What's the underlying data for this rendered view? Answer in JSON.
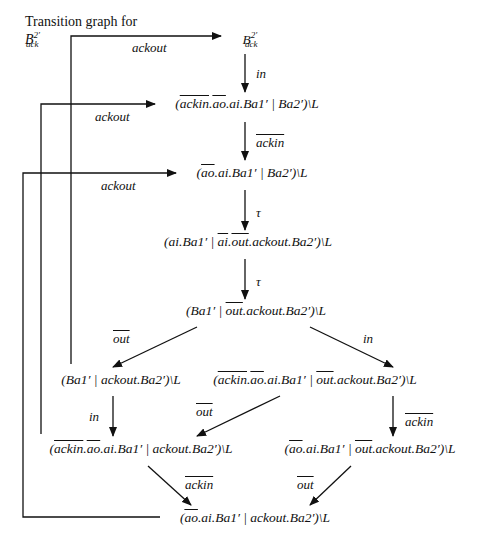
{
  "title": {
    "prefix": "Transition graph for ",
    "symbol": "B",
    "sup": "2′",
    "sub": "ack"
  },
  "nodes": {
    "n0": {
      "symbol": "B",
      "sup": "2′",
      "sub": "ack"
    },
    "n1": "(ackin.ao.ai.Ba1′ | Ba2′)\\L",
    "n2": "(ao.ai.Ba1′ | Ba2′)\\L",
    "n3": "(ai.Ba1′ | ai.out.ackout.Ba2′)\\L",
    "n4": "(Ba1′ | out.ackout.Ba2′)\\L",
    "n5": "(Ba1′ | ackout.Ba2′)\\L",
    "n6": "(ackin.ao.ai.Ba1′ | out.ackout.Ba2′)\\L",
    "n7": "(ackin.ao.ai.Ba1′ | ackout.Ba2′)\\L",
    "n8": "(ao.ai.Ba1′ | out.ackout.Ba2′)\\L",
    "n9": "(ao.ai.Ba1′ | ackout.Ba2′)\\L"
  },
  "edges": [
    {
      "from": "n0",
      "to": "n1",
      "label": "in",
      "overline": false
    },
    {
      "from": "n1",
      "to": "n2",
      "label": "ackin",
      "overline": true
    },
    {
      "from": "n2",
      "to": "n3",
      "label": "τ",
      "overline": false
    },
    {
      "from": "n3",
      "to": "n4",
      "label": "τ",
      "overline": false
    },
    {
      "from": "n4",
      "to": "n5",
      "label": "out",
      "overline": true
    },
    {
      "from": "n4",
      "to": "n6",
      "label": "in",
      "overline": false
    },
    {
      "from": "n5",
      "to": "n7",
      "label": "in",
      "overline": false
    },
    {
      "from": "n6",
      "to": "n7",
      "label": "out",
      "overline": true
    },
    {
      "from": "n6",
      "to": "n8",
      "label": "ackin",
      "overline": true
    },
    {
      "from": "n7",
      "to": "n9",
      "label": "ackin",
      "overline": true
    },
    {
      "from": "n8",
      "to": "n9",
      "label": "out",
      "overline": true
    },
    {
      "from": "n5",
      "to": "n0",
      "label": "ackout",
      "overline": false
    },
    {
      "from": "n7",
      "to": "n1",
      "label": "ackout",
      "overline": false
    },
    {
      "from": "n9",
      "to": "n2",
      "label": "ackout",
      "overline": false
    }
  ]
}
